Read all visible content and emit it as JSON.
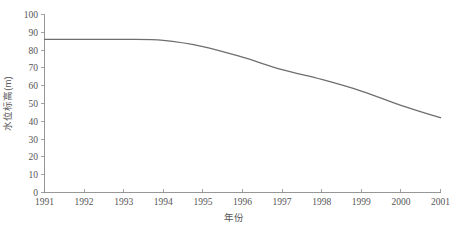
{
  "chart_data": {
    "type": "line",
    "title": "",
    "xlabel": "年份",
    "ylabel": "水位标高(m)",
    "xlim": [
      1991,
      2001
    ],
    "ylim": [
      0,
      100
    ],
    "grid": false,
    "legend": "none",
    "x_ticks": [
      "1991",
      "1992",
      "1993",
      "1994",
      "1995",
      "1996",
      "1997",
      "1998",
      "1999",
      "2000",
      "2001"
    ],
    "y_ticks": [
      "0",
      "10",
      "20",
      "30",
      "40",
      "50",
      "60",
      "70",
      "80",
      "90",
      "100"
    ],
    "line_color": "#6e6e6e",
    "axis_color": "#8c8c8c",
    "x": [
      1991,
      1992,
      1993,
      1994,
      1995,
      1996,
      1997,
      1998,
      1999,
      2000,
      2001
    ],
    "values": [
      86,
      86,
      86,
      85.5,
      82,
      76,
      69,
      63.5,
      57,
      49,
      42
    ],
    "series": [
      {
        "name": "水位标高",
        "values": [
          86,
          86,
          86,
          85.5,
          82,
          76,
          69,
          63.5,
          57,
          49,
          42
        ]
      }
    ]
  }
}
